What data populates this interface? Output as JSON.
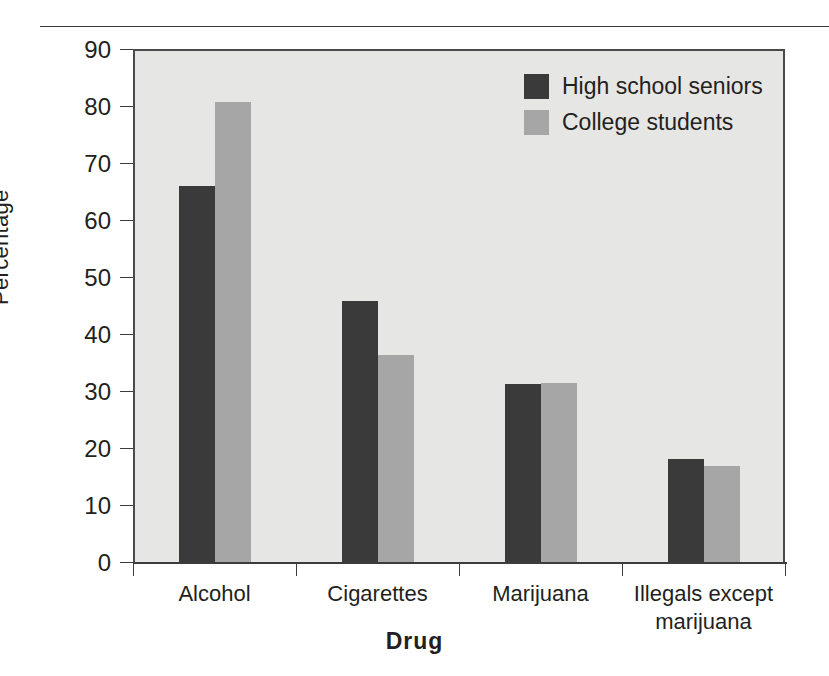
{
  "chart_data": {
    "type": "bar",
    "title": "",
    "xlabel": "Drug",
    "ylabel": "Percentage",
    "ylim": [
      0,
      90
    ],
    "yticks": [
      0,
      10,
      20,
      30,
      40,
      50,
      60,
      70,
      80,
      90
    ],
    "grid": false,
    "legend_position": "top-right",
    "categories": [
      "Alcohol",
      "Cigarettes",
      "Marijuana",
      "Illegals except marijuana"
    ],
    "series": [
      {
        "name": "High school seniors",
        "color": "#3a3a3a",
        "values": [
          66.0,
          45.8,
          31.3,
          18.1
        ]
      },
      {
        "name": "College students",
        "color": "#a6a6a6",
        "values": [
          80.7,
          36.3,
          31.4,
          16.8
        ]
      }
    ]
  },
  "figure": {
    "plot_background": "#e6e6e4",
    "axis_color": "#3c3c3c",
    "text_color": "#231f20"
  }
}
